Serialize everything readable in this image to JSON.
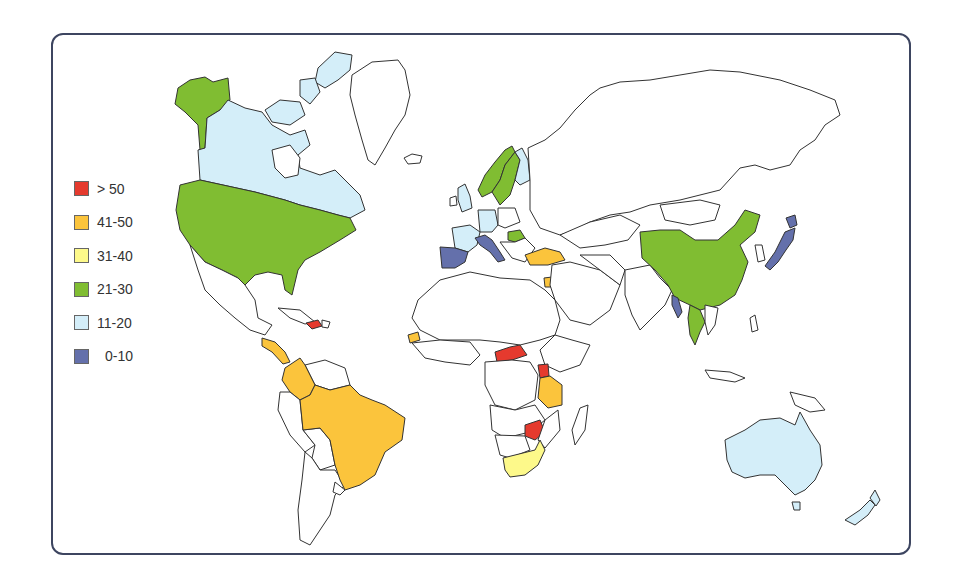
{
  "legend": {
    "items": [
      {
        "label": "> 50",
        "color": "#e53a2e"
      },
      {
        "label": "41-50",
        "color": "#fbc43c"
      },
      {
        "label": "31-40",
        "color": "#fdf98a"
      },
      {
        "label": "21-30",
        "color": "#80bd32"
      },
      {
        "label": "11-20",
        "color": "#d4eef9"
      },
      {
        "label": "0-10",
        "color": "#6470ab"
      }
    ]
  },
  "map": {
    "type": "choropleth world map",
    "unshaded_color": "#ffffff",
    "regions": [
      {
        "name": "Alaska",
        "class": "21-30"
      },
      {
        "name": "United States",
        "class": "21-30"
      },
      {
        "name": "Canada",
        "class": "11-20"
      },
      {
        "name": "Canadian Arctic Islands",
        "class": "11-20"
      },
      {
        "name": "Haiti",
        "class": "> 50"
      },
      {
        "name": "Central America",
        "class": "41-50"
      },
      {
        "name": "Colombia",
        "class": "41-50"
      },
      {
        "name": "Brazil",
        "class": "41-50"
      },
      {
        "name": "Norway",
        "class": "21-30"
      },
      {
        "name": "Sweden",
        "class": "21-30"
      },
      {
        "name": "Finland",
        "class": "11-20"
      },
      {
        "name": "United Kingdom",
        "class": "11-20"
      },
      {
        "name": "Germany",
        "class": "11-20"
      },
      {
        "name": "France",
        "class": "11-20"
      },
      {
        "name": "Spain",
        "class": "0-10"
      },
      {
        "name": "Italy",
        "class": "0-10"
      },
      {
        "name": "Hungary",
        "class": "21-30"
      },
      {
        "name": "Turkey",
        "class": "41-50"
      },
      {
        "name": "Israel/Jordan",
        "class": "41-50"
      },
      {
        "name": "Senegal",
        "class": "41-50"
      },
      {
        "name": "Central African Republic",
        "class": "> 50"
      },
      {
        "name": "Uganda",
        "class": "> 50"
      },
      {
        "name": "Tanzania",
        "class": "41-50"
      },
      {
        "name": "Zimbabwe",
        "class": "> 50"
      },
      {
        "name": "South Africa",
        "class": "31-40"
      },
      {
        "name": "China",
        "class": "21-30"
      },
      {
        "name": "Thailand",
        "class": "21-30"
      },
      {
        "name": "Myanmar",
        "class": "0-10"
      },
      {
        "name": "Japan",
        "class": "0-10"
      },
      {
        "name": "Australia",
        "class": "11-20"
      },
      {
        "name": "New Zealand",
        "class": "11-20"
      }
    ]
  }
}
